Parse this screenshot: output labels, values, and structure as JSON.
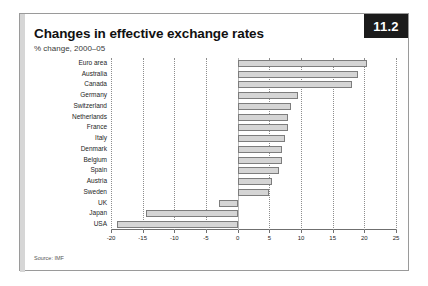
{
  "figure": {
    "badge": "11.2",
    "title": "Changes in effective exchange rates",
    "subtitle": "% change, 2000–05",
    "source": "Source: IMF"
  },
  "chart_data": {
    "type": "bar",
    "orientation": "horizontal",
    "title": "Changes in effective exchange rates",
    "subtitle": "% change, 2000–05",
    "xlabel": "",
    "ylabel": "",
    "xlim": [
      -20,
      25
    ],
    "xticks": [
      -20,
      -15,
      -10,
      -5,
      0,
      5,
      10,
      15,
      20,
      25
    ],
    "xtick_labels": [
      "-20",
      "-15",
      "-10",
      "-5",
      "0",
      "5",
      "10",
      "15",
      "20",
      "25"
    ],
    "grid": true,
    "legend": false,
    "source": "Source: IMF",
    "categories": [
      "Euro area",
      "Australia",
      "Canada",
      "Germany",
      "Switzerland",
      "Netherlands",
      "France",
      "Italy",
      "Denmark",
      "Belgium",
      "Spain",
      "Austria",
      "Sweden",
      "UK",
      "Japan",
      "USA"
    ],
    "values": [
      20.5,
      19,
      18,
      9.5,
      8.5,
      8,
      8,
      7.5,
      7,
      7,
      6.5,
      5.5,
      5,
      -3,
      -14.5,
      -19
    ]
  },
  "colors": {
    "bar_fill": "#d5d5d5",
    "bar_border": "#7d7d7d",
    "badge_bg": "#1b1b1b",
    "badge_text": "#ffffff",
    "frame": "#9a9a9a",
    "grid": "#8d8d8d"
  }
}
